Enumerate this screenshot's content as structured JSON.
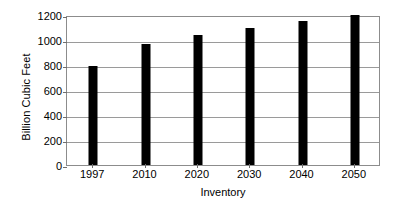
{
  "chart_data": {
    "type": "bar",
    "title": "",
    "xlabel": "Inventory",
    "ylabel": "Billion Cubic Feet",
    "categories": [
      "1997",
      "2010",
      "2020",
      "2030",
      "2040",
      "2050"
    ],
    "values": [
      790,
      970,
      1040,
      1100,
      1150,
      1200
    ],
    "series": [
      {
        "name": "Inventory",
        "values": [
          790,
          970,
          1040,
          1100,
          1150,
          1200
        ]
      }
    ],
    "ylim": [
      0,
      1200
    ],
    "yticks": [
      0,
      200,
      400,
      600,
      800,
      1000,
      1200
    ],
    "ytick_labels": [
      "0",
      "200",
      "400",
      "600",
      "800",
      "1000",
      "1200"
    ],
    "grid": true,
    "grid_axis": "y",
    "legend": false,
    "legend_position": "none",
    "bar_color": "#000000",
    "grid_color": "#9a9a9a",
    "axis_color": "#8c8c8c",
    "background_color": "#ffffff"
  }
}
